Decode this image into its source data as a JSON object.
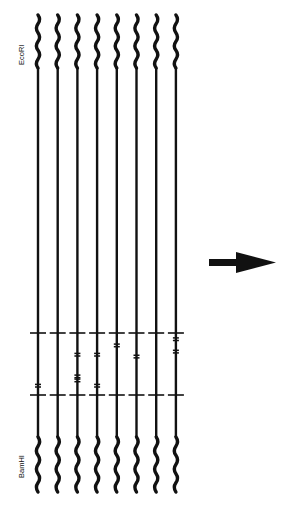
{
  "title": "",
  "labels": {
    "top_site": "EcoRI",
    "bottom_site": "BamHI"
  },
  "colors": {
    "ink": "#111111",
    "background": "#ffffff"
  },
  "strands": [
    {
      "id": 1,
      "mutations": [
        {
          "position": 0.85,
          "count": 1
        }
      ]
    },
    {
      "id": 2,
      "mutations": []
    },
    {
      "id": 3,
      "mutations": [
        {
          "position": 0.35,
          "count": 1
        },
        {
          "position": 0.7,
          "count": 2
        }
      ]
    },
    {
      "id": 4,
      "mutations": [
        {
          "position": 0.35,
          "count": 1
        },
        {
          "position": 0.85,
          "count": 1
        }
      ]
    },
    {
      "id": 5,
      "mutations": [
        {
          "position": 0.2,
          "count": 1
        }
      ]
    },
    {
      "id": 6,
      "mutations": [
        {
          "position": 0.38,
          "count": 1
        }
      ]
    },
    {
      "id": 7,
      "mutations": []
    },
    {
      "id": 8,
      "mutations": [
        {
          "position": 0.1,
          "count": 1
        },
        {
          "position": 0.3,
          "count": 1
        }
      ]
    }
  ],
  "arrow": {
    "direction": "right",
    "icon": "right-arrow-icon"
  }
}
